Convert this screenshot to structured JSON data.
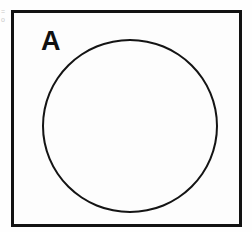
{
  "diagram": {
    "type": "venn",
    "title": "",
    "universe": {
      "name": "universal-set-rectangle",
      "shape": "rectangle",
      "filled": false,
      "border_color": "#121212",
      "border_width_px": 3,
      "x": 11,
      "y": 10,
      "width": 231,
      "height": 217
    },
    "sets": [
      {
        "label": "A",
        "shape": "circle",
        "filled": false,
        "shaded": false,
        "border_color": "#141414",
        "border_width_px": 2,
        "center_x": 127,
        "center_y": 123,
        "diameter": 175
      }
    ],
    "shaded_regions": [],
    "background_color": "#fefefe",
    "label_color": "#101010"
  },
  "artifacts": {
    "left_margin_marks": [
      "=",
      "o"
    ]
  }
}
